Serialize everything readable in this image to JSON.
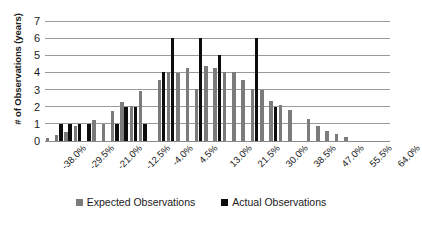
{
  "chart_data": {
    "type": "bar",
    "title": "",
    "subtitle": "",
    "xlabel": "",
    "ylabel": "# of Observations (years)",
    "ylim": [
      0,
      7
    ],
    "yticks": [
      0,
      1,
      2,
      3,
      4,
      5,
      6,
      7
    ],
    "grid": true,
    "legend_position": "bottom-center",
    "xtick_labels": [
      "-38.0%",
      "-29.5%",
      "-21.0%",
      "-12.5%",
      "-4.0%",
      "4.5%",
      "13.0%",
      "21.5%",
      "30.0%",
      "38.5%",
      "47.0%",
      "55.5%",
      "64.0%"
    ],
    "categories": [
      "-38.0%",
      "-35.2%",
      "-32.4%",
      "-29.5%",
      "-26.7%",
      "-23.9%",
      "-21.0%",
      "-18.2%",
      "-15.4%",
      "-12.5%",
      "-9.7%",
      "-6.9%",
      "-4.0%",
      "-1.2%",
      "1.6%",
      "4.5%",
      "7.3%",
      "10.1%",
      "13.0%",
      "15.8%",
      "18.6%",
      "21.5%",
      "24.3%",
      "27.1%",
      "30.0%",
      "32.8%",
      "35.6%",
      "38.5%",
      "41.3%",
      "44.1%",
      "47.0%",
      "49.8%",
      "52.6%",
      "55.5%",
      "58.3%",
      "61.1%",
      "64.0%"
    ],
    "series": [
      {
        "name": "Expected Observations",
        "color": "#7b7b7b",
        "values": [
          0.2,
          0.35,
          0.55,
          0.85,
          0.0,
          1.25,
          1.0,
          1.75,
          2.3,
          2.05,
          2.9,
          0.0,
          3.55,
          4.05,
          3.95,
          4.25,
          3.05,
          4.35,
          4.25,
          4.0,
          4.05,
          3.55,
          3.05,
          2.95,
          2.35,
          2.1,
          1.8,
          0.0,
          1.3,
          0.9,
          0.6,
          0.4,
          0.25,
          0.0,
          0.0,
          0.0,
          0.0
        ]
      },
      {
        "name": "Actual Observations",
        "color": "#0d0d0d",
        "values": [
          0,
          1,
          1,
          1,
          1,
          0,
          0,
          1,
          2,
          2,
          1,
          0,
          4,
          6,
          0,
          0,
          6,
          0,
          5,
          0,
          0,
          0,
          6,
          0,
          2,
          0,
          0,
          0,
          0,
          0,
          0,
          0,
          0,
          0,
          0,
          0,
          0
        ]
      }
    ]
  },
  "legend": {
    "entries": [
      {
        "label": "Expected Observations",
        "marker": "square-gray"
      },
      {
        "label": "Actual Observations",
        "marker": "square-black"
      }
    ]
  }
}
